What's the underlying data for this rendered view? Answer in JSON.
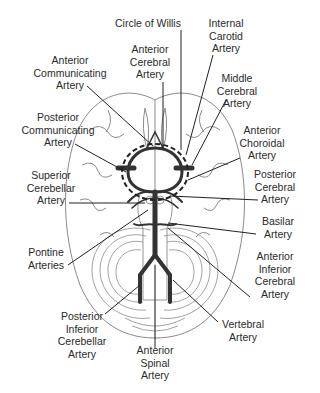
{
  "diagram": {
    "title": "Circle of Willis",
    "colors": {
      "artery": "#333333",
      "outline": "#8a8a8a",
      "leader": "#222222",
      "background": "#ffffff"
    }
  },
  "labels": {
    "circle_of_willis": {
      "lines": [
        "Circle of Willis"
      ]
    },
    "internal_carotid": {
      "lines": [
        "Internal",
        "Carotid",
        "Artery"
      ]
    },
    "anterior_cerebral": {
      "lines": [
        "Anterior",
        "Cerebral",
        "Artery"
      ]
    },
    "anterior_communicating": {
      "lines": [
        "Anterior",
        "Communicating",
        "Artery"
      ]
    },
    "middle_cerebral": {
      "lines": [
        "Middle",
        "Cerebral",
        "Artery"
      ]
    },
    "posterior_communicating": {
      "lines": [
        "Posterior",
        "Communicating",
        "Artery"
      ]
    },
    "anterior_choroidal": {
      "lines": [
        "Anterior",
        "Choroidal",
        "Artery"
      ]
    },
    "superior_cerebellar": {
      "lines": [
        "Superior",
        "Cerebellar",
        "Artery"
      ]
    },
    "posterior_cerebral": {
      "lines": [
        "Posterior",
        "Cerebral",
        "Artery"
      ]
    },
    "basilar": {
      "lines": [
        "Basilar",
        "Artery"
      ]
    },
    "pontine": {
      "lines": [
        "Pontine",
        "Arteries"
      ]
    },
    "anterior_inferior_cerebral": {
      "lines": [
        "Anterior",
        "Inferior",
        "Cerebral",
        "Artery"
      ]
    },
    "vertebral": {
      "lines": [
        "Vertebral",
        "Artery"
      ]
    },
    "posterior_inferior_cerebellar": {
      "lines": [
        "Posterior",
        "Inferior",
        "Cerebellar",
        "Artery"
      ]
    },
    "anterior_spinal": {
      "lines": [
        "Anterior",
        "Spinal",
        "Artery"
      ]
    }
  }
}
